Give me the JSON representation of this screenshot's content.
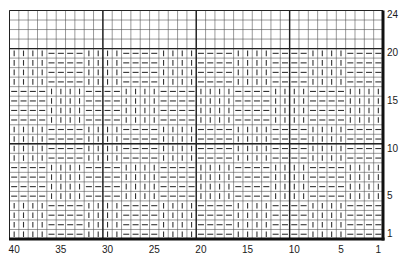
{
  "chart": {
    "title": "",
    "type": "knitting-chart",
    "columns": 40,
    "rows": 24,
    "column_labels": [
      "40",
      "35",
      "30",
      "25",
      "20",
      "15",
      "10",
      "5",
      "1"
    ],
    "column_label_positions": [
      40,
      35,
      30,
      25,
      20,
      15,
      10,
      5,
      1
    ],
    "row_labels": [
      "24",
      "20",
      "15",
      "10",
      "5",
      "1"
    ],
    "row_label_positions": [
      24,
      20,
      15,
      10,
      5,
      1
    ],
    "thick_column_dividers_after": [
      30,
      20,
      10
    ],
    "thick_row_dividers_above": [
      10,
      20
    ],
    "symbols": {
      "knit": "|",
      "purl": "—",
      "empty": ""
    },
    "legend": [],
    "colors": {
      "grid_line": "#555555",
      "thick_line": "#222222",
      "border": "#111111",
      "symbol": "#333333",
      "background": "#ffffff"
    }
  },
  "chart_data": {
    "type": "table",
    "xlabel": "Stitch (40 → 1, right to left)",
    "ylabel": "Row (1 → 24, bottom to top)",
    "x_ticks": [
      40,
      35,
      30,
      25,
      20,
      15,
      10,
      5,
      1
    ],
    "y_ticks": [
      24,
      20,
      15,
      10,
      5,
      1
    ],
    "repeat": "8-stitch repeat, 4 knit + 4 purl; blocks switch every 4 rows",
    "row_patterns": {
      "A": "KKKKPPPPKKKKPPPPKKKKPPPPKKKKPPPPKKKKPPPP",
      "B": "PPPPKKKKPPPPKKKKPPPPKKKKPPPPKKKKPPPPKKKK",
      "E": "........................................"
    },
    "rows": [
      {
        "row": 24,
        "pattern": "E"
      },
      {
        "row": 23,
        "pattern": "E"
      },
      {
        "row": 22,
        "pattern": "E"
      },
      {
        "row": 21,
        "pattern": "E"
      },
      {
        "row": 20,
        "pattern": "A"
      },
      {
        "row": 19,
        "pattern": "A"
      },
      {
        "row": 18,
        "pattern": "A"
      },
      {
        "row": 17,
        "pattern": "A"
      },
      {
        "row": 16,
        "pattern": "B"
      },
      {
        "row": 15,
        "pattern": "B"
      },
      {
        "row": 14,
        "pattern": "B"
      },
      {
        "row": 13,
        "pattern": "B"
      },
      {
        "row": 12,
        "pattern": "A"
      },
      {
        "row": 11,
        "pattern": "A"
      },
      {
        "row": 10,
        "pattern": "A"
      },
      {
        "row": 9,
        "pattern": "A"
      },
      {
        "row": 8,
        "pattern": "B"
      },
      {
        "row": 7,
        "pattern": "B"
      },
      {
        "row": 6,
        "pattern": "B"
      },
      {
        "row": 5,
        "pattern": "B"
      },
      {
        "row": 4,
        "pattern": "A"
      },
      {
        "row": 3,
        "pattern": "A"
      },
      {
        "row": 2,
        "pattern": "A"
      },
      {
        "row": 1,
        "pattern": "A"
      }
    ],
    "legend": {
      "K": "knit (vertical bar)",
      "P": "purl (horizontal dash)",
      ".": "empty"
    }
  }
}
